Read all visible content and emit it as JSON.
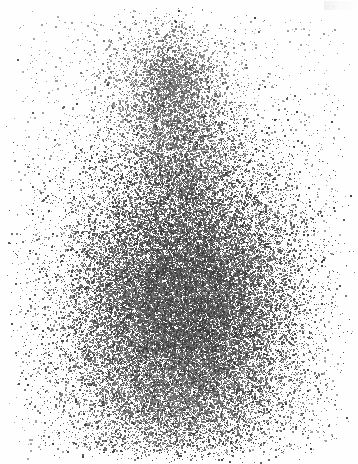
{
  "image": {
    "kind": "scintigram",
    "title": "Radionuclide dot scan",
    "caption": "",
    "width": 358,
    "height": 464,
    "background_color": "#fefefe",
    "dot_color_light": "#b4b4b4",
    "dot_color_mid": "#7a7a7a",
    "dot_color_dark": "#3c3c3c",
    "corner_artifact_label": ""
  },
  "chart_data": {
    "type": "scatter",
    "xlabel": "",
    "ylabel": "",
    "xlim": [
      0,
      358
    ],
    "ylim": [
      0,
      464
    ],
    "grid": false,
    "legend_position": "none",
    "tick_labels_x": [],
    "tick_labels_y": [],
    "annotations": [],
    "total_points": 48000,
    "seed": 20240731,
    "regions": [
      {
        "name": "upper-lobe",
        "shape": "gaussian",
        "cx": 168,
        "cy": 92,
        "sx": 36,
        "sy": 40,
        "weight": 0.055,
        "intensity": 0.42
      },
      {
        "name": "upper-lobe-core",
        "shape": "gaussian",
        "cx": 172,
        "cy": 80,
        "sx": 18,
        "sy": 22,
        "weight": 0.03,
        "intensity": 0.62
      },
      {
        "name": "neck",
        "shape": "gaussian",
        "cx": 180,
        "cy": 160,
        "sx": 26,
        "sy": 34,
        "weight": 0.055,
        "intensity": 0.58
      },
      {
        "name": "body-main",
        "shape": "gaussian",
        "cx": 180,
        "cy": 300,
        "sx": 62,
        "sy": 86,
        "weight": 0.47,
        "intensity": 0.8
      },
      {
        "name": "body-core",
        "shape": "gaussian",
        "cx": 186,
        "cy": 305,
        "sx": 42,
        "sy": 58,
        "weight": 0.25,
        "intensity": 0.95
      },
      {
        "name": "body-left-wing",
        "shape": "gaussian",
        "cx": 125,
        "cy": 305,
        "sx": 34,
        "sy": 66,
        "weight": 0.06,
        "intensity": 0.62
      },
      {
        "name": "body-right-wing",
        "shape": "gaussian",
        "cx": 240,
        "cy": 290,
        "sx": 32,
        "sy": 62,
        "weight": 0.055,
        "intensity": 0.62
      },
      {
        "name": "lower-taper",
        "shape": "gaussian",
        "cx": 180,
        "cy": 398,
        "sx": 54,
        "sy": 30,
        "weight": 0.06,
        "intensity": 0.5
      },
      {
        "name": "scatter-halo",
        "shape": "uniform",
        "x0": 20,
        "y0": 20,
        "x1": 338,
        "y1": 450,
        "weight": 0.035,
        "intensity": 0.18
      },
      {
        "name": "scatter-field",
        "shape": "uniform",
        "x0": 4,
        "y0": 4,
        "x1": 354,
        "y1": 460,
        "weight": 0.01,
        "intensity": 0.1
      }
    ]
  }
}
